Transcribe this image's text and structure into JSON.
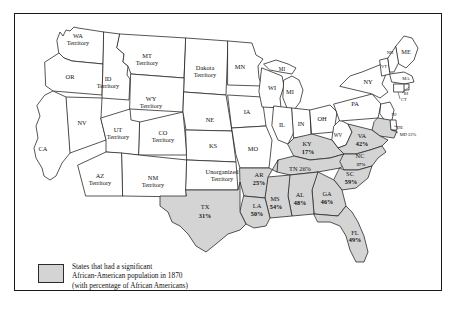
{
  "figure": {
    "title": "States that had a significant African-American population in 1870"
  },
  "legend": {
    "swatch_name": "shaded-state-swatch",
    "line1": "States that had a significant",
    "line2": "African-American population in 1870",
    "line3": "(with percentage of African Americans)",
    "swatch_color": "#d4d4d4",
    "border_color": "#2b2b2b"
  },
  "chart_data": {
    "type": "map",
    "title": "States that had a significant African-American population in 1870",
    "region": "United States",
    "year": 1870,
    "value_unit": "percent",
    "shaded_color": "#d4d4d4",
    "unshaded_color": "#ffffff",
    "shaded_states": [
      {
        "code": "TX",
        "percent": 31,
        "label": "TX",
        "value_label": "31%"
      },
      {
        "code": "AR",
        "percent": 25,
        "label": "AR",
        "value_label": "25%"
      },
      {
        "code": "LA",
        "percent": 50,
        "label": "LA",
        "value_label": "50%"
      },
      {
        "code": "MS",
        "percent": 54,
        "label": "MS",
        "value_label": "54%"
      },
      {
        "code": "AL",
        "percent": 48,
        "label": "AL",
        "value_label": "48%"
      },
      {
        "code": "GA",
        "percent": 46,
        "label": "GA",
        "value_label": "46%"
      },
      {
        "code": "FL",
        "percent": 49,
        "label": "FL",
        "value_label": "49%"
      },
      {
        "code": "SC",
        "percent": 59,
        "label": "SC",
        "value_label": "59%"
      },
      {
        "code": "NC",
        "percent": 37,
        "label": "NC",
        "value_label": "37%"
      },
      {
        "code": "TN",
        "percent": 26,
        "label": "TN",
        "value_label": "TN 26%"
      },
      {
        "code": "KY",
        "percent": 17,
        "label": "KY",
        "value_label": "17%"
      },
      {
        "code": "VA",
        "percent": 42,
        "label": "VA",
        "value_label": "42%"
      },
      {
        "code": "MD",
        "percent": 22,
        "label": "MD",
        "value_label": "MD 22%"
      }
    ],
    "unshaded_labels": [
      "WA Territory",
      "OR",
      "ID Territory",
      "MT Territory",
      "Dakota Territory",
      "WY Territory",
      "NV",
      "CA",
      "UT Territory",
      "CO Territory",
      "NE",
      "KS",
      "AZ Territory",
      "NM Territory",
      "Unorganized Territory",
      "MN",
      "IA",
      "MO",
      "WI",
      "MI",
      "IL",
      "IN",
      "OH",
      "WV",
      "PA",
      "NY",
      "VT",
      "NH",
      "ME",
      "MA",
      "RI",
      "CT",
      "NJ",
      "DE"
    ]
  },
  "map": {
    "states": [
      {
        "id": "wa",
        "name": "WA Territory",
        "label_lines": [
          "WA",
          "Territory"
        ],
        "shaded": false,
        "lx": 78,
        "ly": 40,
        "size": "normal"
      },
      {
        "id": "or",
        "name": "OR",
        "label_lines": [
          "OR"
        ],
        "shaded": false,
        "lx": 70,
        "ly": 78,
        "size": "normal"
      },
      {
        "id": "id",
        "name": "ID Territory",
        "label_lines": [
          "ID",
          "Territory"
        ],
        "shaded": false,
        "lx": 108,
        "ly": 83,
        "size": "normal"
      },
      {
        "id": "mt",
        "name": "MT Territory",
        "label_lines": [
          "MT",
          "Territory"
        ],
        "shaded": false,
        "lx": 147,
        "ly": 60,
        "size": "normal"
      },
      {
        "id": "dak",
        "name": "Dakota Territory",
        "label_lines": [
          "Dakota",
          "Territory"
        ],
        "shaded": false,
        "lx": 205,
        "ly": 72,
        "size": "normal"
      },
      {
        "id": "wy",
        "name": "WY Territory",
        "label_lines": [
          "WY",
          "Territory"
        ],
        "shaded": false,
        "lx": 151,
        "ly": 103,
        "size": "normal"
      },
      {
        "id": "nv",
        "name": "NV",
        "label_lines": [
          "NV"
        ],
        "shaded": false,
        "lx": 82,
        "ly": 124,
        "size": "normal"
      },
      {
        "id": "ca",
        "name": "CA",
        "label_lines": [
          "CA"
        ],
        "shaded": false,
        "lx": 43,
        "ly": 150,
        "size": "normal"
      },
      {
        "id": "ut",
        "name": "UT Territory",
        "label_lines": [
          "UT",
          "Territory"
        ],
        "shaded": false,
        "lx": 118,
        "ly": 134,
        "size": "normal"
      },
      {
        "id": "co",
        "name": "CO Territory",
        "label_lines": [
          "CO",
          "Territory"
        ],
        "shaded": false,
        "lx": 163,
        "ly": 137,
        "size": "normal"
      },
      {
        "id": "ne",
        "name": "NE",
        "label_lines": [
          "NE"
        ],
        "shaded": false,
        "lx": 210,
        "ly": 121,
        "size": "normal"
      },
      {
        "id": "ks",
        "name": "KS",
        "label_lines": [
          "KS"
        ],
        "shaded": false,
        "lx": 213,
        "ly": 147,
        "size": "normal"
      },
      {
        "id": "az",
        "name": "AZ Territory",
        "label_lines": [
          "AZ",
          "Territory"
        ],
        "shaded": false,
        "lx": 100,
        "ly": 180,
        "size": "normal"
      },
      {
        "id": "nm",
        "name": "NM Territory",
        "label_lines": [
          "NM",
          "Territory"
        ],
        "shaded": false,
        "lx": 153,
        "ly": 182,
        "size": "normal"
      },
      {
        "id": "unorg",
        "name": "Unorganized Territory",
        "label_lines": [
          "Unorganized",
          "Territory"
        ],
        "shaded": false,
        "lx": 222,
        "ly": 176,
        "size": "normal"
      },
      {
        "id": "mn",
        "name": "MN",
        "label_lines": [
          "MN"
        ],
        "shaded": false,
        "lx": 240,
        "ly": 68,
        "size": "normal"
      },
      {
        "id": "ia",
        "name": "IA",
        "label_lines": [
          "IA"
        ],
        "shaded": false,
        "lx": 247,
        "ly": 113,
        "size": "normal"
      },
      {
        "id": "mo",
        "name": "MO",
        "label_lines": [
          "MO"
        ],
        "shaded": false,
        "lx": 253,
        "ly": 150,
        "size": "normal"
      },
      {
        "id": "wi",
        "name": "WI",
        "label_lines": [
          "WI"
        ],
        "shaded": false,
        "lx": 272,
        "ly": 89,
        "size": "normal"
      },
      {
        "id": "mi",
        "name": "MI",
        "label_lines": [
          "MI"
        ],
        "shaded": false,
        "lx": 290,
        "ly": 93,
        "size": "normal"
      },
      {
        "id": "mi2",
        "name": "MI Upper",
        "label_lines": [
          "MI"
        ],
        "shaded": false,
        "lx": 282,
        "ly": 70,
        "size": "small"
      },
      {
        "id": "il",
        "name": "IL",
        "label_lines": [
          "IL"
        ],
        "shaded": false,
        "lx": 282,
        "ly": 126,
        "size": "normal"
      },
      {
        "id": "in",
        "name": "IN",
        "label_lines": [
          "IN"
        ],
        "shaded": false,
        "lx": 301,
        "ly": 125,
        "size": "normal"
      },
      {
        "id": "oh",
        "name": "OH",
        "label_lines": [
          "OH"
        ],
        "shaded": false,
        "lx": 322,
        "ly": 120,
        "size": "normal"
      },
      {
        "id": "wv",
        "name": "WV",
        "label_lines": [
          "WV"
        ],
        "shaded": false,
        "lx": 338,
        "ly": 136,
        "size": "small"
      },
      {
        "id": "pa",
        "name": "PA",
        "label_lines": [
          "PA"
        ],
        "shaded": false,
        "lx": 355,
        "ly": 105,
        "size": "normal"
      },
      {
        "id": "ny",
        "name": "NY",
        "label_lines": [
          "NY"
        ],
        "shaded": false,
        "lx": 368,
        "ly": 83,
        "size": "normal"
      },
      {
        "id": "vt",
        "name": "VT",
        "label_lines": [
          "VT"
        ],
        "shaded": false,
        "lx": 384,
        "ly": 67,
        "size": "tiny"
      },
      {
        "id": "nh",
        "name": "NH",
        "label_lines": [
          "NH"
        ],
        "shaded": false,
        "lx": 390,
        "ly": 53,
        "size": "tiny"
      },
      {
        "id": "me",
        "name": "ME",
        "label_lines": [
          "ME"
        ],
        "shaded": false,
        "lx": 406,
        "ly": 53,
        "size": "normal"
      },
      {
        "id": "ma",
        "name": "MA",
        "label_lines": [
          "MA"
        ],
        "shaded": false,
        "lx": 406,
        "ly": 79,
        "size": "tiny"
      },
      {
        "id": "ri",
        "name": "RI",
        "label_lines": [
          "RI"
        ],
        "shaded": false,
        "lx": 406,
        "ly": 94,
        "size": "tiny"
      },
      {
        "id": "ct",
        "name": "CT",
        "label_lines": [
          "CT"
        ],
        "shaded": false,
        "lx": 404,
        "ly": 100,
        "size": "tiny"
      },
      {
        "id": "nj",
        "name": "NJ",
        "label_lines": [
          "NJ"
        ],
        "shaded": false,
        "lx": 394,
        "ly": 115,
        "size": "tiny"
      },
      {
        "id": "de",
        "name": "DE",
        "label_lines": [
          "DE"
        ],
        "shaded": false,
        "lx": 400,
        "ly": 128,
        "size": "tiny"
      },
      {
        "id": "md",
        "name": "MD",
        "label_lines": [
          "MD 22%"
        ],
        "shaded": true,
        "lx": 408,
        "ly": 135,
        "size": "tiny"
      },
      {
        "id": "va",
        "name": "VA",
        "label_lines": [
          "VA"
        ],
        "shaded": true,
        "lx": 362,
        "ly": 137,
        "size": "normal"
      },
      {
        "id": "ky",
        "name": "KY",
        "label_lines": [
          "KY"
        ],
        "shaded": true,
        "lx": 307,
        "ly": 145,
        "size": "normal"
      },
      {
        "id": "tn",
        "name": "TN",
        "label_lines": [
          "TN 26%"
        ],
        "shaded": true,
        "lx": 300,
        "ly": 170,
        "size": "normal"
      },
      {
        "id": "nc",
        "name": "NC",
        "label_lines": [
          "NC"
        ],
        "shaded": true,
        "lx": 360,
        "ly": 157,
        "size": "normal"
      },
      {
        "id": "sc",
        "name": "SC",
        "label_lines": [
          "SC"
        ],
        "shaded": true,
        "lx": 350,
        "ly": 175,
        "size": "normal"
      },
      {
        "id": "ga",
        "name": "GA",
        "label_lines": [
          "GA"
        ],
        "shaded": true,
        "lx": 327,
        "ly": 195,
        "size": "normal"
      },
      {
        "id": "al",
        "name": "AL",
        "label_lines": [
          "AL"
        ],
        "shaded": true,
        "lx": 300,
        "ly": 196,
        "size": "normal"
      },
      {
        "id": "ms",
        "name": "MS",
        "label_lines": [
          "MS"
        ],
        "shaded": true,
        "lx": 275,
        "ly": 200,
        "size": "normal"
      },
      {
        "id": "ar",
        "name": "AR",
        "label_lines": [
          "AR"
        ],
        "shaded": true,
        "lx": 259,
        "ly": 176,
        "size": "normal"
      },
      {
        "id": "la",
        "name": "LA",
        "label_lines": [
          "LA"
        ],
        "shaded": true,
        "lx": 257,
        "ly": 207,
        "size": "normal"
      },
      {
        "id": "tx",
        "name": "TX",
        "label_lines": [
          "TX"
        ],
        "shaded": true,
        "lx": 205,
        "ly": 208,
        "size": "normal"
      },
      {
        "id": "fl",
        "name": "FL",
        "label_lines": [
          "FL"
        ],
        "shaded": true,
        "lx": 355,
        "ly": 234,
        "size": "normal"
      }
    ],
    "percent_labels": [
      {
        "id": "pct-tx",
        "text": "31%",
        "x": 205,
        "y": 217,
        "size": "normal"
      },
      {
        "id": "pct-ar",
        "text": "25%",
        "x": 259,
        "y": 184,
        "size": "normal"
      },
      {
        "id": "pct-la",
        "text": "50%",
        "x": 257,
        "y": 215,
        "size": "normal"
      },
      {
        "id": "pct-ms",
        "text": "54%",
        "x": 276,
        "y": 208,
        "size": "normal"
      },
      {
        "id": "pct-al",
        "text": "48%",
        "x": 300,
        "y": 204,
        "size": "normal"
      },
      {
        "id": "pct-ga",
        "text": "46%",
        "x": 327,
        "y": 203,
        "size": "normal"
      },
      {
        "id": "pct-fl",
        "text": "49%",
        "x": 355,
        "y": 241,
        "size": "normal"
      },
      {
        "id": "pct-sc",
        "text": "59%",
        "x": 351,
        "y": 183,
        "size": "normal"
      },
      {
        "id": "pct-nc",
        "text": "37%",
        "x": 361,
        "y": 165,
        "size": "tiny"
      },
      {
        "id": "pct-ky",
        "text": "17%",
        "x": 308,
        "y": 153,
        "size": "normal"
      },
      {
        "id": "pct-va",
        "text": "42%",
        "x": 362,
        "y": 145,
        "size": "normal"
      }
    ]
  }
}
